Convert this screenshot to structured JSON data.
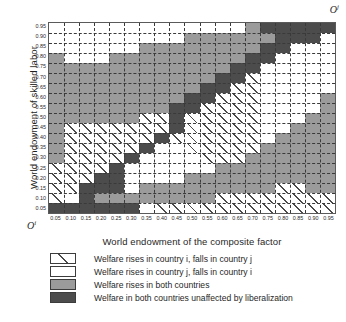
{
  "chart_data": {
    "type": "heatmap",
    "title": "",
    "xlabel": "World endowment of the composite factor",
    "ylabel": "World endowment of skilled labor",
    "origin_bottom_left": "O",
    "origin_bottom_left_sup": "i",
    "origin_top_right": "O",
    "origin_top_right_sup": "j",
    "grid": true,
    "xlim": [
      0.025,
      0.975
    ],
    "ylim": [
      0.025,
      0.975
    ],
    "x": [
      0.05,
      0.1,
      0.15,
      0.2,
      0.25,
      0.3,
      0.35,
      0.4,
      0.45,
      0.5,
      0.55,
      0.6,
      0.65,
      0.7,
      0.75,
      0.8,
      0.85,
      0.9,
      0.95
    ],
    "y": [
      0.05,
      0.1,
      0.15,
      0.2,
      0.25,
      0.3,
      0.35,
      0.4,
      0.45,
      0.5,
      0.55,
      0.6,
      0.65,
      0.7,
      0.75,
      0.8,
      0.85,
      0.9,
      0.95
    ],
    "xticklabels": [
      "0.05",
      "0.10",
      "0.15",
      "0.20",
      "0.25",
      "0.30",
      "0.35",
      "0.40",
      "0.45",
      "0.50",
      "0.55",
      "0.60",
      "0.65",
      "0.70",
      "0.75",
      "0.80",
      "0.85",
      "0.90",
      "0.95"
    ],
    "yticklabels": [
      "0.05",
      "0.10",
      "0.15",
      "0.20",
      "0.25",
      "0.30",
      "0.35",
      "0.40",
      "0.45",
      "0.50",
      "0.55",
      "0.60",
      "0.65",
      "0.70",
      "0.75",
      "0.80",
      "0.85",
      "0.90",
      "0.95"
    ],
    "categories": [
      {
        "key": "hatch",
        "label": "Welfare rises in country i, falls in country j",
        "fill": "white-with-diagonal-hatch",
        "color": "#ffffff",
        "hatch_color": "#4a4a4a"
      },
      {
        "key": "white",
        "label": "Welfare rises in country j, falls in country i",
        "fill": "solid",
        "color": "#ffffff"
      },
      {
        "key": "mid",
        "label": "Welfare rises in both countries",
        "fill": "solid",
        "color": "#9b9b9b"
      },
      {
        "key": "dark",
        "label": "Welfare in both countries unaffected by liberalization",
        "fill": "solid",
        "color": "#4c4c4c"
      }
    ],
    "cells_legend": "rows listed from top (y=0.95) down to bottom (y=0.05); each row lists 19 cells left (x=0.05) to right (x=0.95)",
    "cells": [
      [
        "white",
        "white",
        "white",
        "white",
        "white",
        "white",
        "white",
        "white",
        "white",
        "white",
        "white",
        "white",
        "white",
        "mid",
        "dark",
        "dark",
        "dark",
        "dark",
        "dark"
      ],
      [
        "white",
        "white",
        "white",
        "white",
        "white",
        "white",
        "white",
        "white",
        "white",
        "mid",
        "mid",
        "mid",
        "mid",
        "mid",
        "mid",
        "dark",
        "dark",
        "dark",
        "white"
      ],
      [
        "white",
        "white",
        "white",
        "white",
        "white",
        "white",
        "mid",
        "mid",
        "mid",
        "mid",
        "mid",
        "mid",
        "mid",
        "mid",
        "dark",
        "dark",
        "white",
        "white",
        "white"
      ],
      [
        "mid",
        "white",
        "white",
        "white",
        "mid",
        "mid",
        "mid",
        "mid",
        "mid",
        "mid",
        "mid",
        "mid",
        "mid",
        "dark",
        "dark",
        "white",
        "white",
        "white",
        "white"
      ],
      [
        "mid",
        "mid",
        "mid",
        "mid",
        "mid",
        "mid",
        "mid",
        "mid",
        "mid",
        "mid",
        "mid",
        "mid",
        "dark",
        "dark",
        "white",
        "white",
        "white",
        "white",
        "white"
      ],
      [
        "mid",
        "mid",
        "mid",
        "mid",
        "mid",
        "mid",
        "mid",
        "mid",
        "mid",
        "mid",
        "mid",
        "dark",
        "dark",
        "hatch",
        "white",
        "white",
        "white",
        "white",
        "white"
      ],
      [
        "mid",
        "mid",
        "mid",
        "mid",
        "mid",
        "mid",
        "mid",
        "mid",
        "mid",
        "mid",
        "dark",
        "dark",
        "hatch",
        "hatch",
        "white",
        "white",
        "white",
        "white",
        "white"
      ],
      [
        "mid",
        "mid",
        "mid",
        "mid",
        "mid",
        "mid",
        "mid",
        "mid",
        "mid",
        "dark",
        "dark",
        "hatch",
        "hatch",
        "hatch",
        "white",
        "white",
        "white",
        "white",
        "mid"
      ],
      [
        "mid",
        "mid",
        "mid",
        "mid",
        "mid",
        "mid",
        "mid",
        "mid",
        "dark",
        "dark",
        "hatch",
        "hatch",
        "hatch",
        "hatch",
        "white",
        "white",
        "white",
        "white",
        "mid"
      ],
      [
        "mid",
        "mid",
        "mid",
        "mid",
        "mid",
        "mid",
        "hatch",
        "hatch",
        "dark",
        "hatch",
        "hatch",
        "hatch",
        "hatch",
        "hatch",
        "white",
        "white",
        "white",
        "mid",
        "mid"
      ],
      [
        "mid",
        "hatch",
        "hatch",
        "hatch",
        "hatch",
        "hatch",
        "hatch",
        "hatch",
        "dark",
        "hatch",
        "hatch",
        "hatch",
        "hatch",
        "hatch",
        "white",
        "white",
        "mid",
        "mid",
        "mid"
      ],
      [
        "mid",
        "hatch",
        "hatch",
        "hatch",
        "hatch",
        "hatch",
        "hatch",
        "dark",
        "hatch",
        "hatch",
        "hatch",
        "hatch",
        "hatch",
        "hatch",
        "white",
        "mid",
        "mid",
        "mid",
        "mid"
      ],
      [
        "mid",
        "hatch",
        "hatch",
        "hatch",
        "hatch",
        "hatch",
        "dark",
        "white",
        "white",
        "hatch",
        "hatch",
        "hatch",
        "hatch",
        "hatch",
        "mid",
        "mid",
        "mid",
        "mid",
        "mid"
      ],
      [
        "mid",
        "hatch",
        "hatch",
        "hatch",
        "hatch",
        "dark",
        "white",
        "white",
        "white",
        "white",
        "hatch",
        "hatch",
        "hatch",
        "mid",
        "mid",
        "mid",
        "mid",
        "mid",
        "mid"
      ],
      [
        "hatch",
        "hatch",
        "hatch",
        "hatch",
        "dark",
        "white",
        "white",
        "white",
        "white",
        "white",
        "white",
        "mid",
        "mid",
        "mid",
        "mid",
        "mid",
        "mid",
        "mid",
        "mid"
      ],
      [
        "hatch",
        "hatch",
        "hatch",
        "dark",
        "dark",
        "white",
        "white",
        "white",
        "white",
        "mid",
        "mid",
        "mid",
        "mid",
        "mid",
        "mid",
        "mid",
        "mid",
        "mid",
        "mid"
      ],
      [
        "hatch",
        "hatch",
        "dark",
        "dark",
        "dark",
        "white",
        "mid",
        "mid",
        "mid",
        "mid",
        "mid",
        "mid",
        "mid",
        "mid",
        "mid",
        "hatch",
        "hatch",
        "mid",
        "mid"
      ],
      [
        "hatch",
        "white",
        "dark",
        "mid",
        "mid",
        "mid",
        "mid",
        "mid",
        "mid",
        "mid",
        "mid",
        "hatch",
        "hatch",
        "hatch",
        "hatch",
        "hatch",
        "hatch",
        "hatch",
        "hatch"
      ],
      [
        "dark",
        "dark",
        "dark",
        "dark",
        "dark",
        "dark",
        "white",
        "hatch",
        "hatch",
        "hatch",
        "hatch",
        "hatch",
        "hatch",
        "hatch",
        "hatch",
        "hatch",
        "hatch",
        "hatch",
        "hatch"
      ]
    ]
  },
  "legend": {
    "items": [
      {
        "swatch": "hatch",
        "label": "Welfare rises in country i, falls in country j"
      },
      {
        "swatch": "white",
        "label": "Welfare rises in country j, falls in country i"
      },
      {
        "swatch": "mid",
        "label": "Welfare rises in both countries"
      },
      {
        "swatch": "dark",
        "label": "Welfare in both countries unaffected by liberalization"
      }
    ]
  }
}
